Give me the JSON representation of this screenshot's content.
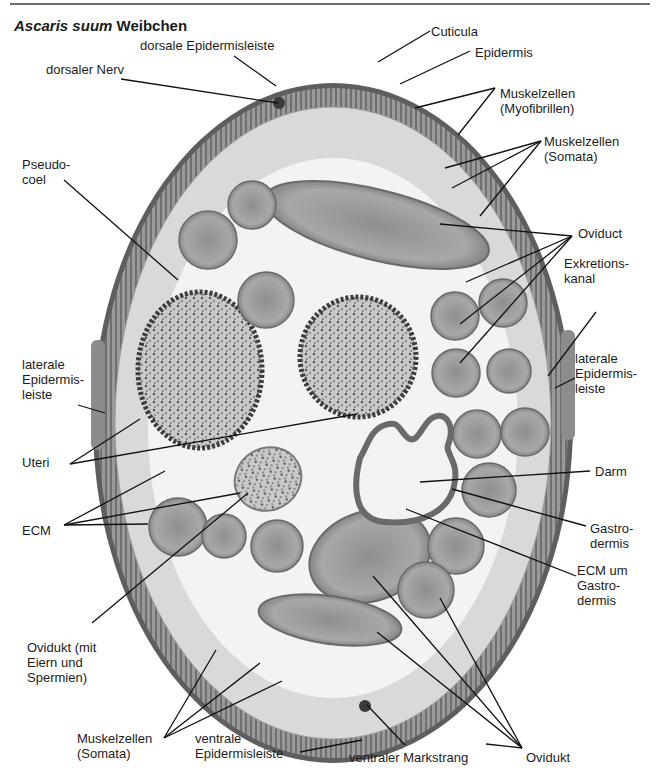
{
  "title": {
    "species": "Ascaris suum",
    "suffix": " Weibchen"
  },
  "colors": {
    "background": "#ffffff",
    "rule": "#6e6e6e",
    "cuticle": "#5e5e5e",
    "muscle_layer": "#8a8a8a",
    "pseudocoel": "#f3f3f3",
    "oviduct": "#a3a3a3",
    "uterus": "#bdbdbd",
    "gut": "#6a6a6a",
    "leader_line": "#111111"
  },
  "labels": [
    {
      "id": "cuticula",
      "lines": [
        "Cuticula"
      ],
      "x": 431,
      "y": 24,
      "leaders": [
        [
          430,
          31,
          378,
          62
        ]
      ]
    },
    {
      "id": "dorsale-epidermisleiste",
      "lines": [
        "dorsale Epidermisleiste"
      ],
      "x": 140,
      "y": 38,
      "leaders": [
        [
          234,
          56,
          276,
          86
        ]
      ]
    },
    {
      "id": "epidermis",
      "lines": [
        "Epidermis"
      ],
      "x": 475,
      "y": 45,
      "leaders": [
        [
          470,
          51,
          400,
          84
        ]
      ]
    },
    {
      "id": "dorsaler-nerv",
      "lines": [
        "dorsaler Nerv"
      ],
      "x": 46,
      "y": 62,
      "leaders": [
        [
          121,
          79,
          278,
          103
        ]
      ]
    },
    {
      "id": "muskelzellen-myofibrillen",
      "lines": [
        "Muskelzellen",
        "(Myofibrillen)"
      ],
      "x": 500,
      "y": 86,
      "leaders": [
        [
          495,
          88,
          415,
          108
        ],
        [
          495,
          88,
          458,
          135
        ]
      ]
    },
    {
      "id": "pseudocoel",
      "lines": [
        "Pseudo-",
        "coel"
      ],
      "x": 22,
      "y": 157,
      "leaders": [
        [
          64,
          180,
          178,
          280
        ]
      ]
    },
    {
      "id": "muskelzellen-somata-top",
      "lines": [
        "Muskelzellen",
        "(Somata)"
      ],
      "x": 544,
      "y": 134,
      "leaders": [
        [
          541,
          141,
          445,
          168
        ],
        [
          541,
          141,
          452,
          188
        ],
        [
          541,
          141,
          480,
          216
        ]
      ]
    },
    {
      "id": "oviduct",
      "lines": [
        "Oviduct"
      ],
      "x": 578,
      "y": 226,
      "leaders": [
        [
          572,
          236,
          440,
          224
        ],
        [
          572,
          236,
          466,
          282
        ],
        [
          572,
          236,
          460,
          324
        ],
        [
          572,
          236,
          460,
          363
        ]
      ]
    },
    {
      "id": "exkretionskanal",
      "lines": [
        "Exkretions-",
        "kanal"
      ],
      "x": 564,
      "y": 256,
      "leaders": [
        [
          596,
          312,
          548,
          376
        ]
      ]
    },
    {
      "id": "laterale-epidermisleiste-right",
      "lines": [
        "laterale",
        "Epidermis-",
        "leiste"
      ],
      "x": 575,
      "y": 351,
      "leaders": [
        [
          575,
          378,
          555,
          388
        ]
      ]
    },
    {
      "id": "laterale-epidermisleiste-left",
      "lines": [
        "laterale",
        "Epidermis-",
        "leiste"
      ],
      "x": 22,
      "y": 357,
      "leaders": [
        [
          78,
          405,
          105,
          413
        ]
      ]
    },
    {
      "id": "uteri",
      "lines": [
        "Uteri"
      ],
      "x": 22,
      "y": 455,
      "leaders": [
        [
          70,
          464,
          140,
          419
        ],
        [
          70,
          464,
          357,
          414
        ]
      ]
    },
    {
      "id": "darm",
      "lines": [
        "Darm"
      ],
      "x": 595,
      "y": 464,
      "leaders": [
        [
          590,
          471,
          420,
          482
        ]
      ]
    },
    {
      "id": "ecm",
      "lines": [
        "ECM"
      ],
      "x": 22,
      "y": 523,
      "leaders": [
        [
          64,
          525,
          165,
          471
        ],
        [
          64,
          525,
          240,
          493
        ],
        [
          64,
          525,
          148,
          524
        ]
      ]
    },
    {
      "id": "gastrodermis",
      "lines": [
        "Gastro-",
        "dermis"
      ],
      "x": 590,
      "y": 521,
      "leaders": [
        [
          586,
          526,
          452,
          489
        ]
      ]
    },
    {
      "id": "ecm-um-gastrodermis",
      "lines": [
        "ECM um",
        "Gastro-",
        "dermis"
      ],
      "x": 577,
      "y": 563,
      "leaders": [
        [
          576,
          576,
          406,
          509
        ]
      ]
    },
    {
      "id": "ovidukt-mit-eiern",
      "lines": [
        "Ovidukt (mit",
        "Eiern und",
        "Spermien)"
      ],
      "x": 27,
      "y": 640,
      "leaders": [
        [
          92,
          623,
          248,
          493
        ]
      ]
    },
    {
      "id": "muskelzellen-somata-bottom",
      "lines": [
        "Muskelzellen",
        "(Somata)"
      ],
      "x": 77,
      "y": 731,
      "leaders": [
        [
          164,
          738,
          216,
          650
        ],
        [
          164,
          738,
          260,
          663
        ],
        [
          164,
          738,
          282,
          681
        ]
      ]
    },
    {
      "id": "ventrale-epidermisleiste",
      "lines": [
        "ventrale",
        "Epidermisleiste"
      ],
      "x": 195,
      "y": 731,
      "leaders": [
        [
          300,
          752,
          362,
          740
        ]
      ]
    },
    {
      "id": "ventraler-markstrang",
      "lines": [
        "ventraler Markstrang"
      ],
      "x": 349,
      "y": 750,
      "leaders": [
        [
          405,
          745,
          367,
          705
        ]
      ]
    },
    {
      "id": "ovidukt",
      "lines": [
        "Ovidukt"
      ],
      "x": 526,
      "y": 750,
      "leaders": [
        [
          522,
          748,
          373,
          576
        ],
        [
          522,
          748,
          377,
          632
        ],
        [
          522,
          748,
          440,
          598
        ],
        [
          522,
          748,
          486,
          744
        ]
      ]
    }
  ],
  "specimen": {
    "body": {
      "cx": 333,
      "cy": 423,
      "rx": 240,
      "ry": 340
    },
    "oviduct_sections": [
      {
        "cx": 208,
        "cy": 240,
        "r": 29
      },
      {
        "cx": 252,
        "cy": 205,
        "r": 24
      },
      {
        "cx": 266,
        "cy": 300,
        "r": 28
      },
      {
        "cx": 455,
        "cy": 316,
        "r": 24
      },
      {
        "cx": 503,
        "cy": 303,
        "r": 24
      },
      {
        "cx": 456,
        "cy": 373,
        "r": 24
      },
      {
        "cx": 509,
        "cy": 371,
        "r": 22
      },
      {
        "cx": 477,
        "cy": 434,
        "r": 24
      },
      {
        "cx": 525,
        "cy": 432,
        "r": 24
      },
      {
        "cx": 489,
        "cy": 490,
        "r": 27
      },
      {
        "cx": 456,
        "cy": 546,
        "r": 28
      },
      {
        "cx": 178,
        "cy": 527,
        "r": 29
      },
      {
        "cx": 224,
        "cy": 536,
        "r": 22
      },
      {
        "cx": 277,
        "cy": 546,
        "r": 26
      },
      {
        "cx": 426,
        "cy": 590,
        "r": 28
      }
    ],
    "large_oviducts": [
      {
        "cx": 377,
        "cy": 225,
        "rx": 115,
        "ry": 35,
        "rot": 14
      },
      {
        "cx": 370,
        "cy": 556,
        "rx": 62,
        "ry": 45,
        "rot": -18
      },
      {
        "cx": 330,
        "cy": 620,
        "rx": 72,
        "ry": 24,
        "rot": 8
      }
    ],
    "uteri": [
      {
        "cx": 200,
        "cy": 370,
        "rx": 62,
        "ry": 78
      },
      {
        "cx": 358,
        "cy": 357,
        "rx": 58,
        "ry": 60
      }
    ],
    "oviduct_with_eggs": {
      "cx": 268,
      "cy": 479,
      "rx": 34,
      "ry": 31
    },
    "gut": {
      "path": "M360 458 C352 490 355 520 385 522 C420 525 452 512 455 480 C458 462 445 452 448 445 C456 425 445 410 432 418 C422 424 418 445 408 438 C398 430 400 420 385 425 C370 430 368 445 360 458 Z"
    }
  }
}
